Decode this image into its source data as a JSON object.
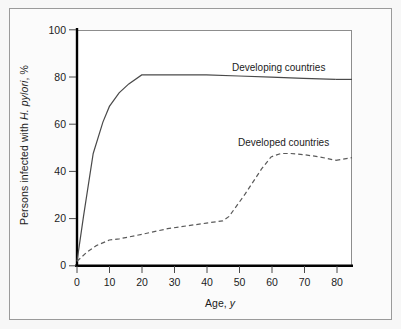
{
  "figure": {
    "background_color": "#fbfbfb",
    "border_color": "#9a9a9a",
    "axis_color": "#000000",
    "line_color": "#3c3c3c"
  },
  "axes": {
    "y_title_prefix": "Persons infected with ",
    "y_title_italic": "H. pylori",
    "y_title_suffix": ", %",
    "x_title_prefix": "Age, ",
    "x_title_italic": "y",
    "x_title_suffix": ""
  },
  "chart_data": {
    "type": "line",
    "title": "",
    "subtitle": "",
    "xlabel": "Age, y",
    "ylabel": "Persons infected with H. pylori, %",
    "xlim": [
      0,
      85
    ],
    "ylim": [
      0,
      105
    ],
    "xticks": [
      0,
      10,
      20,
      30,
      40,
      50,
      60,
      70,
      80
    ],
    "xtick_labels": [
      "0",
      "10",
      "20",
      "30",
      "40",
      "50",
      "60",
      "70",
      "80"
    ],
    "yticks": [
      0,
      20,
      40,
      60,
      80,
      100
    ],
    "ytick_labels": [
      "0",
      "20",
      "40",
      "60",
      "80",
      "100"
    ],
    "grid": false,
    "legend_position": "inline-annotation",
    "series": [
      {
        "name": "Developing countries",
        "style": "solid",
        "label_x": 55,
        "label_y": 92,
        "x": [
          0,
          2,
          5,
          8,
          10,
          13,
          16,
          20,
          30,
          40,
          50,
          60,
          70,
          80
        ],
        "y": [
          2,
          22,
          50,
          64,
          71,
          77,
          81,
          85,
          85,
          85,
          84.5,
          84,
          83.5,
          83
        ]
      },
      {
        "name": "Developed countries",
        "style": "dashed",
        "label_x": 56,
        "label_y": 58,
        "x": [
          0,
          3,
          6,
          10,
          13,
          20,
          28,
          35,
          40,
          45,
          47,
          52,
          57,
          60,
          63,
          66,
          70,
          75,
          80
        ],
        "y": [
          2,
          6,
          9,
          11.5,
          12,
          14,
          16.5,
          18,
          19,
          20,
          22,
          32,
          43,
          48.5,
          50,
          50,
          49.5,
          48.5,
          47
        ]
      }
    ]
  },
  "series_labels": {
    "developing": "Developing countries",
    "developed": "Developed countries"
  }
}
